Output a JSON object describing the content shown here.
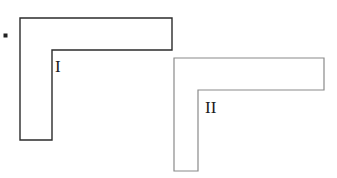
{
  "canvas": {
    "width": 337,
    "height": 178,
    "background": "#ffffff"
  },
  "bullet": {
    "name": "bullet-dot",
    "x": 3.5,
    "y": 33.5,
    "size": 4,
    "color": "#222222"
  },
  "figures": [
    {
      "id": "figure-1",
      "label": "I",
      "stroke_color": "#2b2b2b",
      "stroke_width": 1.4,
      "fill": "#ffffff",
      "points": "20,18 172,18 172,50 52,50 52,140 20,140",
      "label_x": 55,
      "label_y": 72,
      "geometry": {
        "outer_left": 20,
        "outer_top": 18,
        "outer_right": 172,
        "outer_bottom": 140,
        "inner_corner_x": 52,
        "inner_corner_y": 50,
        "horizontal_arm_thickness": 32,
        "vertical_arm_thickness": 32
      }
    },
    {
      "id": "figure-2",
      "label": "II",
      "stroke_color": "#8a8a8a",
      "stroke_width": 1.2,
      "fill": "#ffffff",
      "points": "174,58 324,58 324,90 198,90 198,171 174,171",
      "label_x": 205,
      "label_y": 113,
      "geometry": {
        "outer_left": 174,
        "outer_top": 58,
        "outer_right": 324,
        "outer_bottom": 171,
        "inner_corner_x": 198,
        "inner_corner_y": 90,
        "horizontal_arm_thickness": 32,
        "vertical_arm_thickness": 24
      }
    }
  ]
}
